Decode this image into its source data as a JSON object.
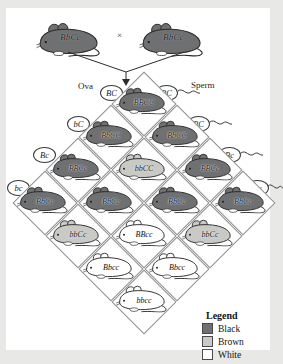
{
  "figure": {
    "type": "punnett-square-dihybrid",
    "orientation": "diamond",
    "parents": {
      "mother_genotype": "BbCc",
      "father_genotype": "BbCc",
      "cross_symbol": "×"
    },
    "gamete_labels": {
      "ova_label": "Ova",
      "sperm_label": "Sperm"
    },
    "ova_gametes": [
      "BC",
      "bC",
      "Bc",
      "bc"
    ],
    "sperm_gametes": [
      "BC",
      "BC",
      "Bc",
      "bc"
    ],
    "offspring_rows": [
      {
        "row": 1,
        "cells": [
          {
            "genotype": "BBCC",
            "color": "black"
          }
        ]
      },
      {
        "row": 2,
        "cells": [
          {
            "genotype": "BbCC",
            "color": "black"
          },
          {
            "genotype": "BbCC",
            "color": "black"
          }
        ]
      },
      {
        "row": 3,
        "cells": [
          {
            "genotype": "BBCc",
            "color": "black"
          },
          {
            "genotype": "bbCC",
            "color": "brown"
          },
          {
            "genotype": "BBCc",
            "color": "black"
          }
        ]
      },
      {
        "row": 4,
        "cells": [
          {
            "genotype": "BbCc",
            "color": "black"
          },
          {
            "genotype": "BbCc",
            "color": "black"
          },
          {
            "genotype": "BbCc",
            "color": "black"
          },
          {
            "genotype": "BbCc",
            "color": "black"
          }
        ]
      },
      {
        "row": 5,
        "cells": [
          {
            "genotype": "bbCc",
            "color": "brown"
          },
          {
            "genotype": "BBcc",
            "color": "white"
          },
          {
            "genotype": "bbCc",
            "color": "brown"
          }
        ]
      },
      {
        "row": 6,
        "cells": [
          {
            "genotype": "Bbcc",
            "color": "white"
          },
          {
            "genotype": "Bbcc",
            "color": "white"
          }
        ]
      },
      {
        "row": 7,
        "cells": [
          {
            "genotype": "bbcc",
            "color": "white"
          }
        ]
      }
    ],
    "legend": {
      "title": "Legend",
      "items": [
        {
          "label": "Black",
          "swatch": "#6f7072"
        },
        {
          "label": "Brown",
          "swatch": "#c9cac6"
        },
        {
          "label": "White",
          "swatch": "#ffffff"
        }
      ]
    },
    "palette": {
      "black_fur": "#6f7072",
      "brown_fur": "#c9cac6",
      "white_fur": "#ffffff",
      "grid_line": "#8d8d8d",
      "ink": "#1c1c1c",
      "page_background": "#e8e8e6",
      "paper": "#ffffff"
    }
  }
}
